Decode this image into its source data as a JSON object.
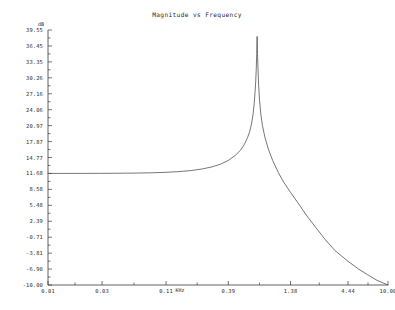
{
  "window": {
    "background_color": "#ffffff",
    "ink_color": "#3a3a3a"
  },
  "chart_data": {
    "type": "line",
    "title": "Magnitude vs Frequency",
    "xlabel": "KHz",
    "ylabel": "dB",
    "xscale": "log",
    "yscale": "linear",
    "grid": false,
    "legend": null,
    "xlim": [
      0.01,
      10.0
    ],
    "ylim": [
      -10.0,
      39.55
    ],
    "xtick_labels": [
      "0.01",
      "0.03",
      "0.11",
      "0.39",
      "1.38",
      "4.44",
      "10.00"
    ],
    "xtick_values": [
      0.01,
      0.03,
      0.11,
      0.39,
      1.38,
      4.44,
      10.0
    ],
    "ytick_labels": [
      "39.55",
      "36.45",
      "33.35",
      "30.26",
      "27.16",
      "24.06",
      "20.97",
      "17.87",
      "14.77",
      "11.68",
      "8.58",
      "5.48",
      "2.39",
      "-0.71",
      "-3.81",
      "-6.90",
      "-10.00"
    ],
    "ytick_values": [
      39.55,
      36.45,
      33.35,
      30.26,
      27.16,
      24.06,
      20.97,
      17.87,
      14.77,
      11.68,
      8.58,
      5.48,
      2.39,
      -0.71,
      -3.81,
      -6.9,
      -10.0
    ],
    "series": [
      {
        "name": "Magnitude",
        "color": "#4a4a4a",
        "x": [
          0.01,
          0.013,
          0.017,
          0.022,
          0.029,
          0.038,
          0.05,
          0.065,
          0.085,
          0.11,
          0.14,
          0.18,
          0.23,
          0.28,
          0.33,
          0.39,
          0.45,
          0.5,
          0.54,
          0.575,
          0.6,
          0.625,
          0.645,
          0.66,
          0.672,
          0.68,
          0.688,
          0.694,
          0.7,
          0.706,
          0.713,
          0.722,
          0.735,
          0.755,
          0.78,
          0.82,
          0.88,
          0.96,
          1.08,
          1.2,
          1.38,
          1.6,
          1.9,
          2.3,
          2.8,
          3.4,
          4.44,
          5.5,
          6.6,
          8.0,
          10.0
        ],
        "y": [
          11.68,
          11.68,
          11.69,
          11.69,
          11.7,
          11.71,
          11.73,
          11.76,
          11.81,
          11.9,
          12.02,
          12.22,
          12.55,
          12.95,
          13.45,
          14.2,
          15.2,
          16.2,
          17.3,
          18.6,
          19.7,
          21.3,
          23.2,
          25.3,
          27.6,
          29.5,
          32.0,
          34.8,
          38.3,
          35.0,
          31.8,
          28.8,
          26.0,
          23.2,
          21.0,
          18.7,
          16.4,
          14.2,
          11.8,
          10.0,
          8.0,
          6.0,
          3.6,
          1.2,
          -1.2,
          -3.3,
          -5.4,
          -6.9,
          -8.0,
          -9.1,
          -10.0
        ],
        "peak": {
          "x": 0.7,
          "y": 38.3
        },
        "passband_level": 11.68
      }
    ]
  },
  "plot_geometry": {
    "left": 48,
    "right": 388,
    "top": 30,
    "bottom": 285
  }
}
